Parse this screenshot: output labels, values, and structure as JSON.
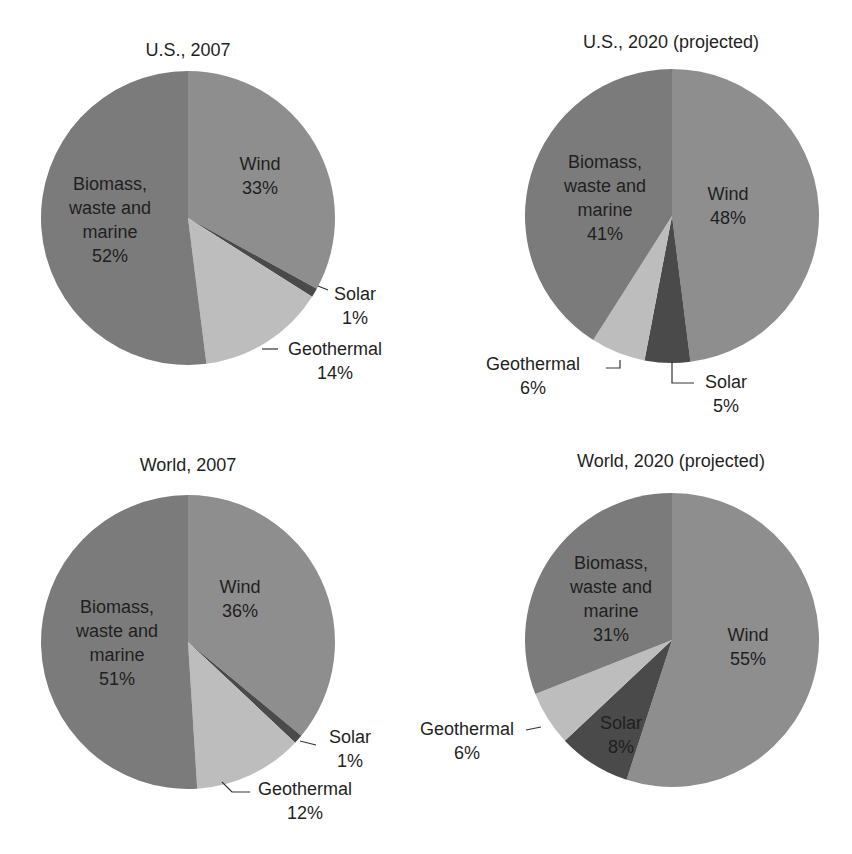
{
  "colors": {
    "wind": "#8e8e8e",
    "solar": "#4a4a4a",
    "geothermal": "#bdbdbd",
    "biomass": "#7b7b7b",
    "leader": "#333333"
  },
  "chart_data": [
    {
      "type": "pie",
      "title": "U.S., 2007",
      "categories": [
        "Wind",
        "Solar",
        "Geothermal",
        "Biomass, waste and marine"
      ],
      "values": [
        33,
        1,
        14,
        52
      ],
      "labels": {
        "wind": "Wind\n33%",
        "solar": "Solar\n1%",
        "geothermal": "Geothermal\n14%",
        "biomass": "Biomass,\nwaste and\nmarine\n52%"
      }
    },
    {
      "type": "pie",
      "title": "U.S., 2020 (projected)",
      "categories": [
        "Wind",
        "Solar",
        "Geothermal",
        "Biomass, waste and marine"
      ],
      "values": [
        48,
        5,
        6,
        41
      ],
      "labels": {
        "wind": "Wind\n48%",
        "solar": "Solar\n5%",
        "geothermal": "Geothermal\n6%",
        "biomass": "Biomass,\nwaste and\nmarine\n41%"
      }
    },
    {
      "type": "pie",
      "title": "World, 2007",
      "categories": [
        "Wind",
        "Solar",
        "Geothermal",
        "Biomass, waste and marine"
      ],
      "values": [
        36,
        1,
        12,
        51
      ],
      "labels": {
        "wind": "Wind\n36%",
        "solar": "Solar\n1%",
        "geothermal": "Geothermal\n12%",
        "biomass": "Biomass,\nwaste and\nmarine\n51%"
      }
    },
    {
      "type": "pie",
      "title": "World, 2020 (projected)",
      "categories": [
        "Wind",
        "Solar",
        "Geothermal",
        "Biomass, waste and marine"
      ],
      "values": [
        55,
        8,
        6,
        31
      ],
      "labels": {
        "wind": "Wind\n55%",
        "solar": "Solar\n8%",
        "geothermal": "Geothermal\n6%",
        "biomass": "Biomass,\nwaste and\nmarine\n31%"
      }
    }
  ]
}
